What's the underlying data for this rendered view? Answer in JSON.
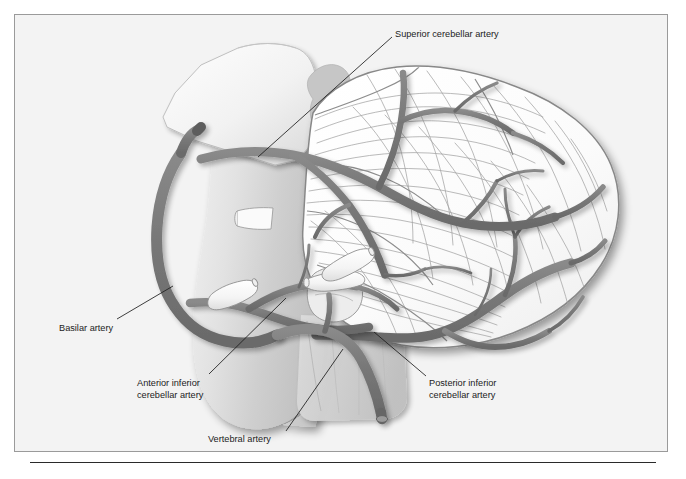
{
  "figure": {
    "background_color": "#f3f3f3",
    "frame_border_color": "#9a9a9a",
    "artery_color": "#7b7b7b",
    "artery_outline_color": "#5f5f5f",
    "folia_line_color": "#9d9d9d",
    "brainstem_fill": "#d8d8d8",
    "cut_face_fill": "#f7f7f7",
    "cerebellum_fill": "#fbfbfb",
    "label_color": "#1c1c1c",
    "leader_color": "#1c1c1c"
  },
  "labels": [
    {
      "id": "superior-cerebellar-artery",
      "lines": [
        "Superior cerebellar artery"
      ],
      "text_x": 394,
      "text_y": 33,
      "leader": {
        "x1": 391,
        "y1": 36,
        "x2": 257,
        "y2": 156
      }
    },
    {
      "id": "basilar-artery",
      "lines": [
        "Basilar artery"
      ],
      "text_x": 58,
      "text_y": 327,
      "leader": {
        "x1": 116,
        "y1": 318,
        "x2": 172,
        "y2": 285
      }
    },
    {
      "id": "anterior-inferior-cerebellar-artery",
      "lines": [
        "Anterior inferior",
        "cerebellar artery"
      ],
      "text_x": 136,
      "text_y": 382,
      "leader": {
        "x1": 208,
        "y1": 373,
        "x2": 285,
        "y2": 297
      }
    },
    {
      "id": "posterior-inferior-cerebellar-artery",
      "lines": [
        "Posterior inferior",
        "cerebellar artery"
      ],
      "text_x": 428,
      "text_y": 382,
      "leader": {
        "x1": 425,
        "y1": 375,
        "x2": 373,
        "y2": 331
      }
    },
    {
      "id": "vertebral-artery",
      "lines": [
        "Vertebral artery"
      ],
      "text_x": 207,
      "text_y": 438,
      "leader": {
        "x1": 285,
        "y1": 430,
        "x2": 342,
        "y2": 348
      }
    }
  ],
  "anatomy": {
    "structures": [
      {
        "name": "midbrain-cut-face",
        "description": "Angled cut surface of the midbrain at upper left"
      },
      {
        "name": "brainstem",
        "description": "Pons and medulla shaded body"
      },
      {
        "name": "cerebellum",
        "description": "Cerebellar hemisphere with folia at right"
      },
      {
        "name": "cranial-nerve-stumps",
        "description": "Three cut white nerve stumps near the pons"
      },
      {
        "name": "flocculus",
        "description": "Small rounded lobule near the vertebral artery"
      }
    ],
    "arteries": [
      {
        "name": "basilar-artery",
        "description": "Large vessel curving along the anterior brainstem"
      },
      {
        "name": "superior-cerebellar-artery",
        "description": "Arises near the top of the basilar and runs over the cerebellum"
      },
      {
        "name": "anterior-inferior-cerebellar-artery",
        "description": "Arises mid-basilar, courses laterally toward the flocculus"
      },
      {
        "name": "posterior-inferior-cerebellar-artery",
        "description": "Arises from the vertebral artery, wraps the inferior cerebellum"
      },
      {
        "name": "vertebral-artery",
        "description": "Ascends from below with a cut rounded end and joins the basilar"
      }
    ]
  }
}
